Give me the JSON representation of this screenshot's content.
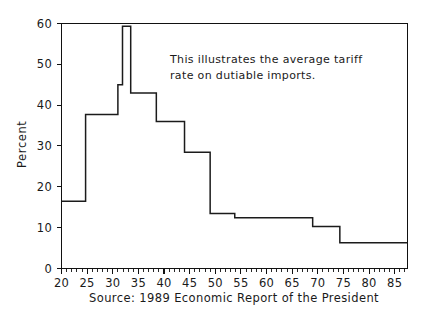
{
  "figure": {
    "background_color": "#ffffff",
    "ink_color": "#1a1a1a",
    "width": 429,
    "height": 321
  },
  "annotation": {
    "line1": "This illustrates the average tariff",
    "line2": "rate on dutiable imports."
  },
  "caption": {
    "text": "Source: 1989 Economic Report of the President"
  },
  "chart_data": {
    "type": "line",
    "title": "",
    "subtitle": "",
    "xlabel": "",
    "ylabel": "Percent",
    "xlim": [
      20,
      87.5
    ],
    "ylim": [
      0,
      60
    ],
    "grid": false,
    "legend": null,
    "legend_position": "none",
    "line_style": "step",
    "line_color": "#1b1b1b",
    "annotations": [
      "This illustrates the average tariff",
      "rate on dutiable imports."
    ],
    "xticks": [
      20,
      25,
      30,
      35,
      40,
      45,
      50,
      55,
      60,
      65,
      70,
      75,
      80,
      85
    ],
    "xtick_labels": [
      "20",
      "25",
      "30",
      "35",
      "40",
      "45",
      "50",
      "55",
      "60",
      "65",
      "70",
      "75",
      "80",
      "85"
    ],
    "xtick_minor_step": 1,
    "yticks": [
      0,
      10,
      20,
      30,
      40,
      50,
      60
    ],
    "ytick_labels": [
      "0",
      "10",
      "20",
      "30",
      "40",
      "50",
      "60"
    ],
    "x": [
      20,
      21,
      22,
      23,
      24,
      25,
      26,
      27,
      28,
      29,
      30,
      31,
      32,
      33,
      34,
      35,
      36,
      37,
      38,
      39,
      40,
      41,
      42,
      43,
      44,
      45,
      46,
      47,
      48,
      49,
      50,
      51,
      52,
      53,
      54,
      55,
      56,
      57,
      58,
      59,
      60,
      61,
      62,
      63,
      64,
      65,
      66,
      67,
      68,
      69,
      70,
      71,
      72,
      73,
      74,
      75,
      76,
      77,
      78,
      79,
      80,
      81,
      82,
      83,
      84,
      85,
      86,
      87
    ],
    "values": [
      16.5,
      16.5,
      16.5,
      16.5,
      16.5,
      37.7,
      37.7,
      37.7,
      37.7,
      37.7,
      45.0,
      45.0,
      59.3,
      59.3,
      43.0,
      43.0,
      43.0,
      43.0,
      43.0,
      36.0,
      36.0,
      36.0,
      36.0,
      36.0,
      36.0,
      28.5,
      28.5,
      28.5,
      28.5,
      28.5,
      13.5,
      13.5,
      13.5,
      13.5,
      13.5,
      12.4,
      12.4,
      12.4,
      12.4,
      12.4,
      12.5,
      12.5,
      12.5,
      12.5,
      12.5,
      12.4,
      12.4,
      12.4,
      12.4,
      12.4,
      10.3,
      10.3,
      10.3,
      10.3,
      10.3,
      6.4,
      6.4,
      6.4,
      6.4,
      6.4,
      6.3,
      6.3,
      6.3,
      6.3,
      6.2,
      6.1,
      6.0,
      5.8
    ],
    "series": [
      {
        "name": "Average tariff rate on dutiable imports",
        "values": [
          16.5,
          16.5,
          16.5,
          16.5,
          16.5,
          37.7,
          37.7,
          37.7,
          37.7,
          37.7,
          45.0,
          45.0,
          59.3,
          59.3,
          43.0,
          43.0,
          43.0,
          43.0,
          43.0,
          36.0,
          36.0,
          36.0,
          36.0,
          36.0,
          36.0,
          28.5,
          28.5,
          28.5,
          28.5,
          28.5,
          13.5,
          13.5,
          13.5,
          13.5,
          13.5,
          12.4,
          12.4,
          12.4,
          12.4,
          12.4,
          12.5,
          12.5,
          12.5,
          12.5,
          12.5,
          12.4,
          12.4,
          12.4,
          12.4,
          12.4,
          10.3,
          10.3,
          10.3,
          10.3,
          10.3,
          6.4,
          6.4,
          6.4,
          6.4,
          6.4,
          6.3,
          6.3,
          6.3,
          6.3,
          6.2,
          6.1,
          6.0,
          5.8
        ]
      }
    ],
    "step_segments": [
      {
        "x_start": 20.0,
        "x_end": 24.7,
        "y": 16.5
      },
      {
        "x_start": 24.7,
        "x_end": 28.8,
        "y": 37.7
      },
      {
        "x_start": 28.8,
        "x_end": 31.0,
        "y": 37.7
      },
      {
        "x_start": 31.0,
        "x_end": 31.9,
        "y": 45.0
      },
      {
        "x_start": 31.9,
        "x_end": 33.5,
        "y": 59.3
      },
      {
        "x_start": 33.5,
        "x_end": 38.5,
        "y": 43.0
      },
      {
        "x_start": 38.5,
        "x_end": 44.0,
        "y": 36.0
      },
      {
        "x_start": 44.0,
        "x_end": 49.0,
        "y": 28.5
      },
      {
        "x_start": 49.0,
        "x_end": 53.8,
        "y": 13.5
      },
      {
        "x_start": 53.8,
        "x_end": 69.0,
        "y": 12.4
      },
      {
        "x_start": 69.0,
        "x_end": 74.3,
        "y": 10.3
      },
      {
        "x_start": 74.3,
        "x_end": 87.5,
        "y": 6.3
      }
    ]
  }
}
